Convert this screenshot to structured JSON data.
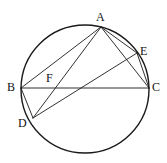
{
  "figure": {
    "stroke_color": "#1a1a1a",
    "label_color": "#111111",
    "background_color": "#ffffff",
    "circle": {
      "name": "circumscribed-circle",
      "cx": 85,
      "cy": 89,
      "r": 64,
      "stroke_width": 1.4
    },
    "points": [
      {
        "id": "A",
        "label": "A",
        "x": 101,
        "y": 27,
        "label_x": 96,
        "label_y": 11,
        "on_circle": true
      },
      {
        "id": "B",
        "label": "B",
        "x": 21,
        "y": 88,
        "label_x": 7,
        "label_y": 81,
        "on_circle": true
      },
      {
        "id": "C",
        "label": "C",
        "x": 149,
        "y": 88,
        "label_x": 152,
        "label_y": 81,
        "on_circle": true
      },
      {
        "id": "D",
        "label": "D",
        "x": 33,
        "y": 118,
        "label_x": 18,
        "label_y": 117,
        "on_circle": true
      },
      {
        "id": "E",
        "label": "E",
        "x": 137,
        "y": 53,
        "label_x": 140,
        "label_y": 45,
        "on_circle": true
      },
      {
        "id": "F",
        "label": "F",
        "x": 55,
        "y": 88,
        "label_x": 46,
        "label_y": 72,
        "on_circle": false
      }
    ],
    "segments": [
      {
        "id": "AB",
        "from": "A",
        "to": "B",
        "x1": 101,
        "y1": 27,
        "x2": 21,
        "y2": 88
      },
      {
        "id": "AC",
        "from": "A",
        "to": "C",
        "x1": 101,
        "y1": 27,
        "x2": 149,
        "y2": 88
      },
      {
        "id": "AD",
        "from": "A",
        "to": "D",
        "x1": 101,
        "y1": 27,
        "x2": 33,
        "y2": 118
      },
      {
        "id": "AE",
        "from": "A",
        "to": "E",
        "x1": 101,
        "y1": 27,
        "x2": 137,
        "y2": 53
      },
      {
        "id": "BC",
        "from": "B",
        "to": "C",
        "x1": 21,
        "y1": 88,
        "x2": 149,
        "y2": 88
      },
      {
        "id": "BD",
        "from": "B",
        "to": "D",
        "x1": 21,
        "y1": 88,
        "x2": 33,
        "y2": 118
      },
      {
        "id": "DE",
        "from": "D",
        "to": "E",
        "x1": 33,
        "y1": 118,
        "x2": 137,
        "y2": 53
      },
      {
        "id": "EC",
        "from": "E",
        "to": "C",
        "x1": 137,
        "y1": 53,
        "x2": 149,
        "y2": 88
      }
    ]
  }
}
